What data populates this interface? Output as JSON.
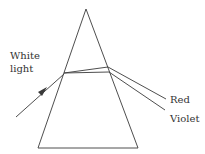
{
  "diagram": {
    "labels": {
      "incident_line1": "White",
      "incident_line2": "light",
      "red": "Red",
      "violet": "Violet"
    },
    "colors": {
      "stroke": "#3a3a3a",
      "text": "#333333",
      "background": "#ffffff"
    }
  }
}
